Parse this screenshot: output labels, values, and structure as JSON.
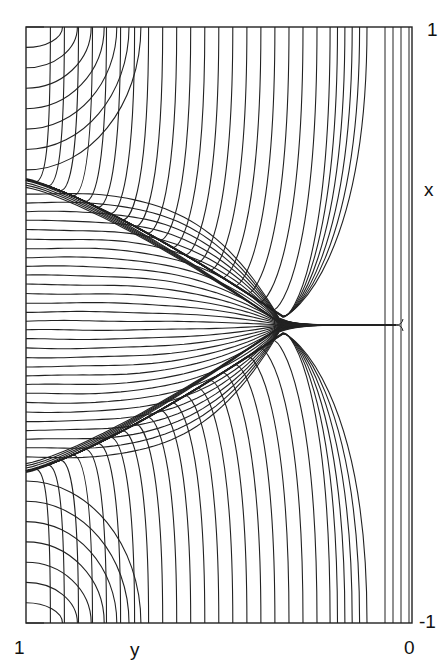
{
  "figure": {
    "axis_labels": {
      "right_top": "1",
      "right_axis": "x",
      "right_bottom": "-1",
      "bottom_left": "1",
      "bottom_axis": "y",
      "bottom_right": "0"
    },
    "frame": {
      "left": 26,
      "top": 27,
      "right": 412,
      "bottom": 623
    },
    "line_color": "#222222",
    "cusp": {
      "x": 283,
      "y": 325
    },
    "separatrix_left_upper_y": 183,
    "separatrix_left_lower_y": 468,
    "tail_end_x": 396,
    "num_inner_lines": 30,
    "num_outer_lines_each_side": 34
  },
  "chart_data": {
    "type": "line",
    "title": "",
    "xlabel": "y",
    "ylabel": "x",
    "xlim": [
      1,
      0
    ],
    "ylim": [
      -1,
      1
    ],
    "x_ticks": [
      "1",
      "0"
    ],
    "y_ticks": [
      "-1",
      "1"
    ],
    "grid": false,
    "legend": null,
    "features": {
      "separatrix_left_x_values": [
        0.52,
        -0.43
      ],
      "cusp_point": {
        "y": 0.33,
        "x": 0.0
      }
    }
  }
}
